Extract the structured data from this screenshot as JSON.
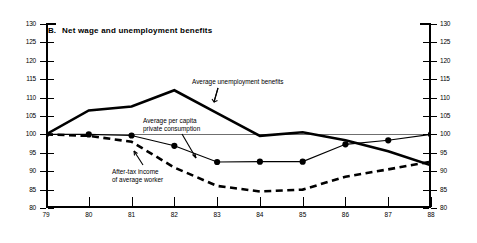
{
  "panel": {
    "letter": "B.",
    "title": "Net wage and unemployment benefits"
  },
  "annotations": {
    "benefits": "Average unemployment benefits",
    "consumption_line1": "Average per capita",
    "consumption_line2": "private consumption",
    "aftertax_line1": "After-tax income",
    "aftertax_line2": "of average worker"
  },
  "axes": {
    "y_ticks_left": [
      "130",
      "125",
      "120",
      "115",
      "110",
      "105",
      "100",
      "95",
      "90",
      "85",
      "80"
    ],
    "y_ticks_right": [
      "130",
      "125",
      "120",
      "115",
      "110",
      "105",
      "100",
      "95",
      "90",
      "85",
      "80"
    ],
    "x_ticks": [
      "79",
      "80",
      "81",
      "82",
      "83",
      "84",
      "85",
      "86",
      "87",
      "88"
    ]
  },
  "colors": {
    "line": "#000000",
    "reference": "#6f6f6f",
    "background": "#ffffff"
  },
  "chart_data": {
    "type": "line",
    "title": "B. Net wage and unemployment benefits",
    "xlabel": "",
    "ylabel": "Index (1979 = 100)",
    "x": [
      1979,
      1980,
      1981,
      1982,
      1983,
      1984,
      1985,
      1986,
      1987,
      1988
    ],
    "tick_labels": [
      "79",
      "80",
      "81",
      "82",
      "83",
      "84",
      "85",
      "86",
      "87",
      "88"
    ],
    "ylim": [
      80,
      130
    ],
    "xlim": [
      1979,
      1988
    ],
    "ytick_step": 5,
    "grid": false,
    "reference_line": 100,
    "legend": "inline annotations",
    "series": [
      {
        "name": "Average unemployment benefits",
        "style": "solid-thick",
        "markers": false,
        "values": [
          100.0,
          106.5,
          107.6,
          112.0,
          105.8,
          99.6,
          100.6,
          98.4,
          95.4,
          91.6
        ]
      },
      {
        "name": "Average per capita private consumption",
        "style": "solid-thin-with-dots",
        "markers": true,
        "values": [
          100.0,
          100.0,
          99.7,
          96.9,
          92.5,
          92.6,
          92.6,
          97.3,
          98.4,
          100.0
        ]
      },
      {
        "name": "After-tax income of average worker",
        "style": "dashed-thick",
        "markers": false,
        "values": [
          100.0,
          99.6,
          98.0,
          91.0,
          86.0,
          84.5,
          85.0,
          88.5,
          90.5,
          92.6
        ]
      }
    ]
  }
}
